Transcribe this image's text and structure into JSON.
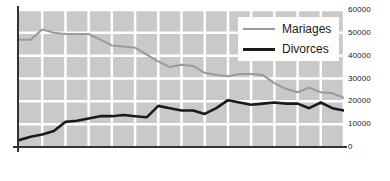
{
  "chart_data": {
    "type": "line",
    "title": "",
    "xlabel": "",
    "ylabel": "",
    "x": [
      1970,
      1971,
      1972,
      1973,
      1974,
      1975,
      1976,
      1977,
      1978,
      1979,
      1980,
      1981,
      1982,
      1983,
      1984,
      1985,
      1986,
      1987,
      1988,
      1989,
      1990,
      1991,
      1992,
      1993,
      1994,
      1995,
      1996,
      1997,
      1998
    ],
    "xtick_labels": [
      "1970",
      "1972",
      "1974",
      "1976",
      "1978",
      "1980",
      "1982",
      "1984",
      "1986",
      "1988",
      "1990",
      "1992",
      "1994",
      "1996",
      "1998"
    ],
    "ytick_labels": [
      "0",
      "10000",
      "20000",
      "30000",
      "40000",
      "50000",
      "60000"
    ],
    "ylim": [
      0,
      60000
    ],
    "xlim": [
      1970,
      1998
    ],
    "grid": true,
    "legend_position": "top-right",
    "series": [
      {
        "name": "Mariages",
        "color": "#9a9a9a",
        "values": [
          47000,
          47000,
          51500,
          50000,
          49500,
          49500,
          49500,
          47000,
          44500,
          44000,
          43500,
          40500,
          37500,
          35000,
          36000,
          35500,
          32500,
          31500,
          31000,
          32000,
          32000,
          31500,
          28000,
          25500,
          24000,
          26000,
          24000,
          23500,
          21500
        ]
      },
      {
        "name": "Divorces",
        "color": "#1a1a1a",
        "values": [
          3000,
          4500,
          5500,
          7000,
          11000,
          11500,
          12500,
          13500,
          13500,
          14000,
          13500,
          13000,
          18000,
          17000,
          16000,
          16000,
          14500,
          17000,
          20500,
          19500,
          18500,
          19000,
          19500,
          19000,
          19000,
          17000,
          19500,
          17000,
          16000
        ]
      }
    ]
  },
  "legend": {
    "items": [
      {
        "label": "Mariages"
      },
      {
        "label": "Divorces"
      }
    ]
  }
}
